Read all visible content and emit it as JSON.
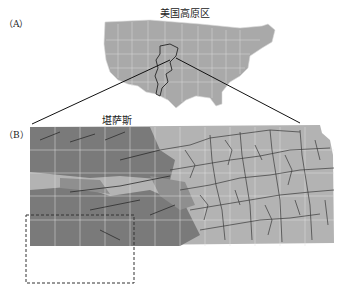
{
  "panel_a": {
    "label": "（A）",
    "title": "美国高原区"
  },
  "panel_b": {
    "label": "（B）",
    "title": "堪萨斯"
  },
  "colors": {
    "us_fill": "#a9a9a9",
    "ks_light": "#b3b3b3",
    "ks_dark": "#7a7a7a",
    "ks_mid": "#8f8f8f",
    "rivers": "#3a3a3a",
    "grid": "#d8d8d8"
  }
}
